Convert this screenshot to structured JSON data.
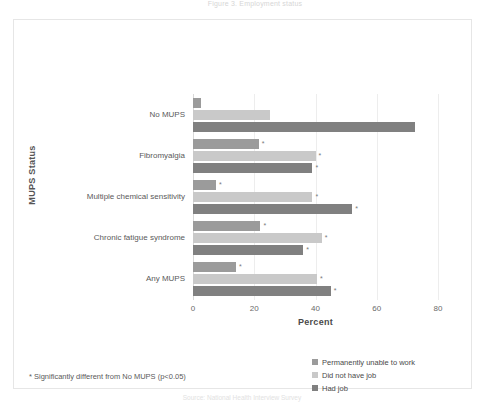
{
  "figure": {
    "title": "Figure 3. Employment status",
    "caption": "Source: National Health Interview Survey"
  },
  "axes": {
    "ylabel": "MUPS Status",
    "xlabel": "Percent",
    "xticks": [
      "0",
      "20",
      "40",
      "60",
      "80"
    ]
  },
  "footnote": "* Significantly different from No MUPS (p<0.05)",
  "legend": {
    "items": [
      {
        "label": "Permanently unable to work",
        "color": "#9b9b9b"
      },
      {
        "label": "Did not have job",
        "color": "#c9c9c9"
      },
      {
        "label": "Had job",
        "color": "#808080"
      }
    ]
  },
  "chart_data": {
    "type": "bar",
    "orientation": "horizontal",
    "title": "Figure 3. Employment status",
    "xlabel": "Percent",
    "ylabel": "MUPS Status",
    "xlim": [
      0,
      80
    ],
    "xticks": [
      0,
      20,
      40,
      60,
      80
    ],
    "grid": true,
    "legend_position": "bottom-right",
    "categories": [
      "No MUPS",
      "Fibromyalgia",
      "Multiple chemical sensitivity",
      "Chronic fatigue syndrome",
      "Any MUPS"
    ],
    "series": [
      {
        "name": "Permanently unable to work",
        "color": "#9b9b9b",
        "values": [
          2.5,
          21.5,
          7.5,
          22.0,
          14.0
        ],
        "significant": [
          false,
          true,
          true,
          true,
          true
        ]
      },
      {
        "name": "Did not have job",
        "color": "#c9c9c9",
        "values": [
          25.0,
          40.0,
          39.0,
          42.0,
          40.5
        ],
        "significant": [
          false,
          true,
          true,
          true,
          true
        ]
      },
      {
        "name": "Had job",
        "color": "#808080",
        "values": [
          72.5,
          39.0,
          52.0,
          36.0,
          45.0
        ],
        "significant": [
          false,
          true,
          true,
          true,
          true
        ]
      }
    ],
    "significance_marker": "*"
  }
}
